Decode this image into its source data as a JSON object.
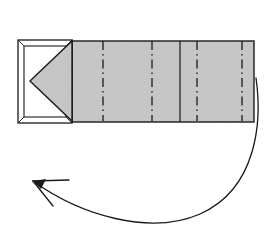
{
  "figure": {
    "background_color": "#ffffff",
    "line_color": "#1a1a1a",
    "paper_fill": "#c6c6c6",
    "panel_fill": "#ffffff",
    "bevel_fill": "#f2f2f2"
  },
  "paper_strip": {
    "name": "paper-strip",
    "fill": "#c6c6c6",
    "stroke": "#1a1a1a",
    "bounds": {
      "x": 18,
      "y": 40,
      "width": 236,
      "height": 83
    },
    "right_edge_x": 254,
    "top_edge_y": 41,
    "bottom_edge_y": 122
  },
  "fold_lines": {
    "style": "dash-dot",
    "label": "valley-fold-line",
    "stroke": "#1a1a1a",
    "count": 4,
    "positions_x": [
      103,
      152,
      197,
      242
    ]
  },
  "panels": {
    "segment_divider_x": [
      72,
      103,
      152,
      197,
      242,
      254
    ],
    "solid_divider_x": [
      72,
      180,
      254
    ]
  },
  "end_panel": {
    "name": "white-end-panel",
    "fill": "#ffffff",
    "stroke": "#1a1a1a",
    "outer": {
      "x": 18,
      "y": 40,
      "width": 54,
      "height": 83
    },
    "inner": {
      "x": 24,
      "y": 46,
      "width": 42,
      "height": 71
    },
    "bevel": "3d-box-edges"
  },
  "triangle_flap": {
    "name": "gray-triangle-flap",
    "fill": "#c6c6c6",
    "stroke": "#1a1a1a",
    "apex": {
      "x": 30,
      "y": 81
    },
    "base_top": {
      "x": 72,
      "y": 41
    },
    "base_bottom": {
      "x": 72,
      "y": 121
    }
  },
  "motion_arrow": {
    "name": "curved-motion-arrow",
    "stroke": "#1a1a1a",
    "stroke_width": 1.3,
    "head_style": "open-v",
    "start": {
      "x": 256,
      "y": 78
    },
    "end": {
      "x": 33,
      "y": 181
    },
    "path": "M256,78 C262,120 258,188 200,214 C150,236 80,215 33,181",
    "head_lines": [
      {
        "x1": 33,
        "y1": 181,
        "x2": 69,
        "y2": 180
      },
      {
        "x1": 33,
        "y1": 181,
        "x2": 53,
        "y2": 206
      }
    ]
  }
}
